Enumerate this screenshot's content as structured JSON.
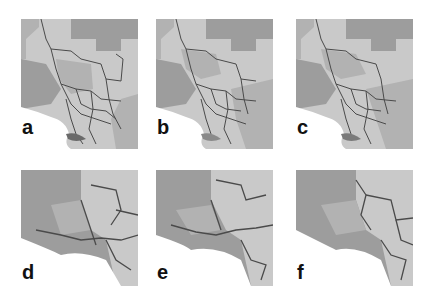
{
  "figure": {
    "colors": {
      "light": "#c9c9c9",
      "mid": "#b2b2b2",
      "dark": "#9d9d9d",
      "border": "#4a4a4a",
      "thin": "#7a7a7a"
    },
    "panels": [
      {
        "id": "a",
        "label": "a",
        "view": "full-region"
      },
      {
        "id": "b",
        "label": "b",
        "view": "full-region"
      },
      {
        "id": "c",
        "label": "c",
        "view": "full-region"
      },
      {
        "id": "d",
        "label": "d",
        "view": "zoomed-coast"
      },
      {
        "id": "e",
        "label": "e",
        "view": "zoomed-coast"
      },
      {
        "id": "f",
        "label": "f",
        "view": "zoomed-coast"
      }
    ]
  }
}
